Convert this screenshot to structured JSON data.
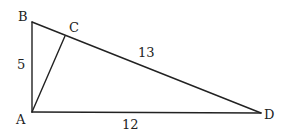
{
  "diagram": {
    "type": "geometry-triangle",
    "points": {
      "A": {
        "label": "A",
        "x": 32,
        "y": 112
      },
      "B": {
        "label": "B",
        "x": 32,
        "y": 22
      },
      "C": {
        "label": "C",
        "x": 65,
        "y": 36
      },
      "D": {
        "label": "D",
        "x": 261,
        "y": 113
      }
    },
    "segments": [
      {
        "from": "A",
        "to": "B",
        "length_label": "5"
      },
      {
        "from": "B",
        "to": "D",
        "length_label": "13"
      },
      {
        "from": "A",
        "to": "D",
        "length_label": "12"
      },
      {
        "from": "A",
        "to": "C",
        "length_label": ""
      }
    ],
    "labels": {
      "A": "A",
      "B": "B",
      "C": "C",
      "D": "D",
      "AB": "5",
      "BD": "13",
      "AD": "12"
    }
  }
}
